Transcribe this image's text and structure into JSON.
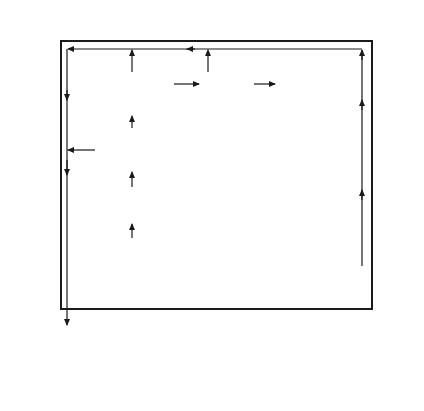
{
  "header": {
    "level_title_line1": "LEVEL OF",
    "level_title_line2": "FUNCTIONING",
    "system_mode_title": "SYSTEM MODE",
    "columns": [
      "Input",
      "Processing",
      "Output"
    ]
  },
  "levels": [
    "Knowledge",
    "Rules",
    "Skills"
  ],
  "boundary_label": "SYSTEM BOUNDARY",
  "nodes": {
    "tests": [
      "Tests for danger",
      "known and carried",
      "out?"
    ],
    "need": [
      "Need for action",
      "recognized?",
      "(Labelled as",
      "danger?)"
    ],
    "responsibility": [
      "Responsibility",
      "accepted",
      "or allocated?"
    ],
    "hazard": [
      "Hazard seeking",
      "initiated?"
    ],
    "plan": [
      "Plan made",
      "and carried out?"
    ],
    "obvious": [
      "Obvious",
      "warning?"
    ],
    "procedure": [
      "Procedure",
      "known and chosen?"
    ],
    "programmed": [
      "Programmed or",
      "insistent danger",
      "signals?"
    ],
    "response": [
      "Response in",
      "program and",
      "carried out?"
    ],
    "unaffected": [
      "Danger",
      "unaffected"
    ],
    "controlled": [
      "Danger brought",
      "(or stays) under",
      "control"
    ],
    "objective": [
      "(Increasing Static Decreasing)",
      "OBJECTIVE DANGER"
    ]
  },
  "edge_labels": {
    "yes": "Yes",
    "no": "No"
  },
  "colors": {
    "line": "#1a1a1a",
    "background": "#ffffff"
  }
}
